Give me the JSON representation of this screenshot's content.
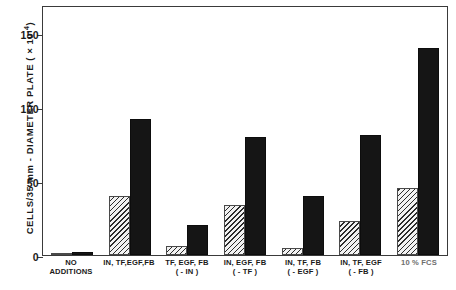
{
  "chart_data": {
    "type": "bar",
    "title": "",
    "xlabel": "",
    "ylabel": "CELLS/35 mm - DIAMETER PLATE ( × 10⁻⁴)",
    "ylabel_main": "CELLS/35 mm - DIAMETER PLATE ( × 10",
    "ylabel_exp": "-4",
    "ylabel_close": ")",
    "ylim": [
      0,
      169
    ],
    "yticks": [
      0,
      50,
      100,
      150
    ],
    "ytick_labels": [
      "0",
      "50",
      "100",
      "150"
    ],
    "grid": false,
    "legend": "none",
    "categories": [
      "NO ADDITIONS",
      "IN, TF,EGF,FB",
      "TF, EGF, FB ( - IN )",
      "IN, EGF, FB ( - TF )",
      "IN, TF, FB ( - EGF )",
      "IN, TF, EGF ( - FB )",
      "10 % FCS"
    ],
    "category_lines": [
      {
        "line1": "NO",
        "line2": "ADDITIONS",
        "faint": false
      },
      {
        "line1": "IN, TF,EGF,FB",
        "line2": "",
        "faint": false
      },
      {
        "line1": "TF, EGF, FB",
        "line2": "( - IN )",
        "faint": false
      },
      {
        "line1": "IN, EGF, FB",
        "line2": "( - TF )",
        "faint": false
      },
      {
        "line1": "IN, TF, FB",
        "line2": "( - EGF )",
        "faint": false
      },
      {
        "line1": "IN, TF, EGF",
        "line2": "( - FB )",
        "faint": false
      },
      {
        "line1": "10 % FCS",
        "line2": "",
        "faint": true
      }
    ],
    "series": [
      {
        "name": "hatched",
        "fill": "diagonal-hatch",
        "values": [
          1.5,
          40,
          6,
          34,
          5,
          23,
          45
        ]
      },
      {
        "name": "solid",
        "fill": "solid-black",
        "values": [
          2,
          92,
          20,
          80,
          40,
          81,
          140
        ]
      }
    ]
  },
  "caption": {
    "text": ""
  }
}
